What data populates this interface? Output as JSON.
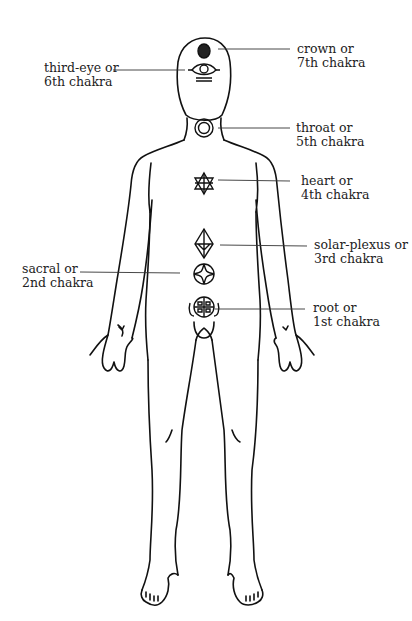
{
  "diagram": {
    "line_color": "#111111",
    "background": "#ffffff",
    "labels": [
      {
        "id": "crown",
        "line1": "crown  or",
        "line2": "7th chakra",
        "side": "right",
        "symbol": "filled-dot"
      },
      {
        "id": "third-eye",
        "line1": "third-eye or",
        "line2": "6th chakra",
        "side": "left",
        "symbol": "eye"
      },
      {
        "id": "throat",
        "line1": "throat or",
        "line2": "5th chakra",
        "side": "right",
        "symbol": "double-circle"
      },
      {
        "id": "heart",
        "line1": "heart  or",
        "line2": "4th chakra",
        "side": "right",
        "symbol": "six-pointed-star"
      },
      {
        "id": "solar-plexus",
        "line1": "solar-plexus or",
        "line2": "3rd chakra",
        "side": "right",
        "symbol": "octahedron"
      },
      {
        "id": "sacral",
        "line1": "sacral or",
        "line2": "2nd chakra",
        "side": "left",
        "symbol": "circle-with-diamond"
      },
      {
        "id": "root",
        "line1": "root or",
        "line2": "1st chakra",
        "side": "right",
        "symbol": "quartered-circle"
      }
    ]
  }
}
